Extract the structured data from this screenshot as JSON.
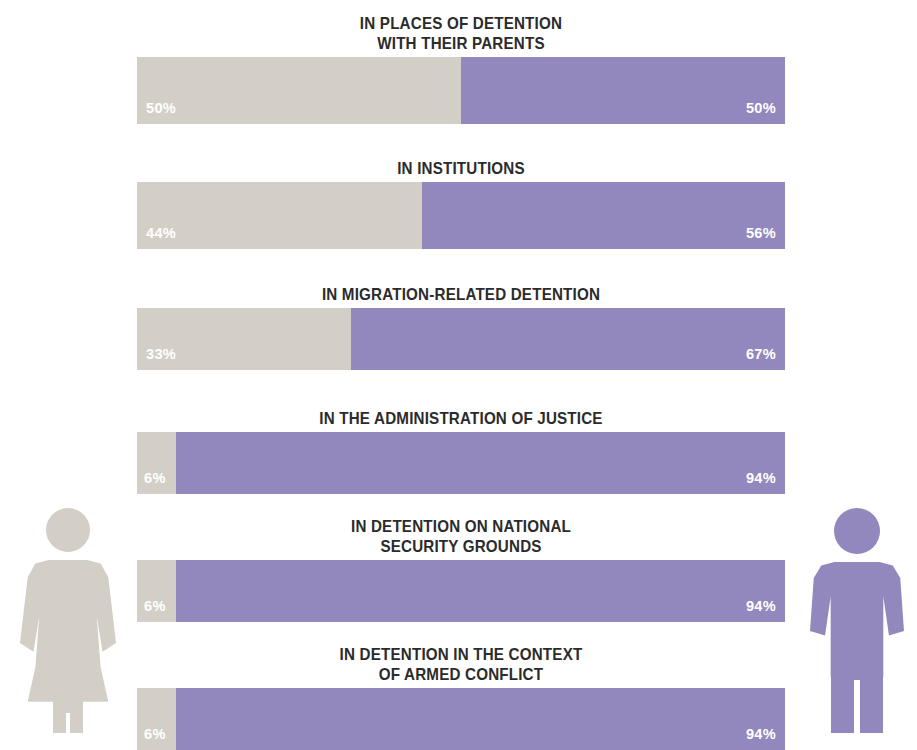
{
  "chart_data": {
    "type": "bar",
    "subtype": "stacked-horizontal-100-percent",
    "title": "",
    "xlabel": "",
    "ylabel": "",
    "xlim": [
      0,
      100
    ],
    "grid": false,
    "legend_position": "none",
    "unit": "%",
    "categories": [
      "IN PLACES OF DETENTION\nWITH THEIR PARENTS",
      "IN INSTITUTIONS",
      "IN MIGRATION-RELATED DETENTION",
      "IN THE ADMINISTRATION OF JUSTICE",
      "IN DETENTION ON NATIONAL\nSECURITY GROUNDS",
      "IN DETENTION IN THE CONTEXT\nOF ARMED CONFLICT"
    ],
    "series": [
      {
        "name": "girls",
        "color": "#d3cfc6",
        "values": [
          50,
          44,
          33,
          6,
          6,
          6
        ]
      },
      {
        "name": "boys",
        "color": "#9288bd",
        "values": [
          50,
          56,
          67,
          94,
          94,
          94
        ]
      }
    ],
    "value_labels": {
      "girls": [
        "50%",
        "44%",
        "33%",
        "6%",
        "6%",
        "6%"
      ],
      "boys": [
        "50%",
        "56%",
        "67%",
        "94%",
        "94%",
        "94%"
      ]
    }
  },
  "rows": [
    {
      "title": "IN PLACES OF DETENTION\nWITH THEIR PARENTS",
      "girls_label": "50%",
      "boys_label": "50%",
      "girls_pct": 50,
      "boys_pct": 50
    },
    {
      "title": "IN INSTITUTIONS",
      "girls_label": "44%",
      "boys_label": "56%",
      "girls_pct": 44,
      "boys_pct": 56
    },
    {
      "title": "IN MIGRATION-RELATED DETENTION",
      "girls_label": "33%",
      "boys_label": "67%",
      "girls_pct": 33,
      "boys_pct": 67
    },
    {
      "title": "IN THE ADMINISTRATION OF JUSTICE",
      "girls_label": "6%",
      "boys_label": "94%",
      "girls_pct": 6,
      "boys_pct": 94
    },
    {
      "title": "IN DETENTION ON NATIONAL\nSECURITY GROUNDS",
      "girls_label": "6%",
      "boys_label": "94%",
      "girls_pct": 6,
      "boys_pct": 94
    },
    {
      "title": "IN DETENTION IN THE CONTEXT\nOF ARMED CONFLICT",
      "girls_label": "6%",
      "boys_label": "94%",
      "girls_pct": 6,
      "boys_pct": 94
    }
  ],
  "colors": {
    "girls": "#d3cfc6",
    "boys": "#9288bd",
    "title_text": "#2b2b2b",
    "value_text": "#ffffff",
    "background": "#ffffff"
  },
  "pictograms": {
    "female": "female-figure-icon",
    "male": "male-figure-icon"
  }
}
